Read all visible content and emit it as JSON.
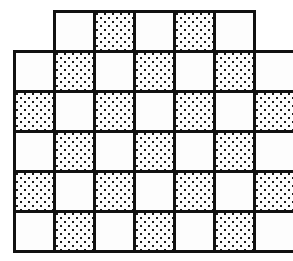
{
  "figure": {
    "cell_size_px": 40,
    "line_color": "#111111",
    "fill_plain": "#fdfdfd",
    "dot_color": "#1a1a1a",
    "rows": [
      {
        "x0": 54,
        "y0": 11,
        "cells": [
          "plain",
          "dotted",
          "plain",
          "dotted",
          "plain"
        ]
      },
      {
        "x0": 14,
        "y0": 51,
        "cells": [
          "plain",
          "dotted",
          "plain",
          "dotted",
          "plain",
          "dotted",
          "plain"
        ]
      },
      {
        "x0": 14,
        "y0": 91,
        "cells": [
          "dotted",
          "plain",
          "dotted",
          "plain",
          "dotted",
          "plain",
          "dotted"
        ]
      },
      {
        "x0": 14,
        "y0": 131,
        "cells": [
          "plain",
          "dotted",
          "plain",
          "dotted",
          "plain",
          "dotted",
          "plain"
        ]
      },
      {
        "x0": 14,
        "y0": 171,
        "cells": [
          "dotted",
          "plain",
          "dotted",
          "plain",
          "dotted",
          "plain",
          "dotted"
        ]
      },
      {
        "x0": 14,
        "y0": 211,
        "cells": [
          "plain",
          "dotted",
          "plain",
          "dotted",
          "plain",
          "dotted",
          "plain"
        ]
      }
    ]
  }
}
